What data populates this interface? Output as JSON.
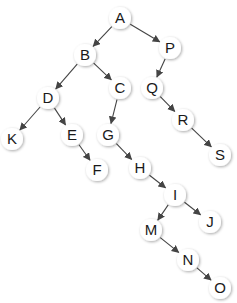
{
  "diagram": {
    "type": "binary-tree",
    "colors": {
      "background": "#ffffff",
      "node_fill": "#ffffff",
      "node_shadow": "#c8c8c8",
      "edge": "#444444",
      "text": "#1a1a1a"
    },
    "node_radius": 11,
    "nodes": [
      {
        "id": "A",
        "label": "A",
        "x": 120,
        "y": 18
      },
      {
        "id": "B",
        "label": "B",
        "x": 85,
        "y": 55
      },
      {
        "id": "P",
        "label": "P",
        "x": 170,
        "y": 48
      },
      {
        "id": "D",
        "label": "D",
        "x": 48,
        "y": 98
      },
      {
        "id": "C",
        "label": "C",
        "x": 120,
        "y": 88
      },
      {
        "id": "Q",
        "label": "Q",
        "x": 152,
        "y": 88
      },
      {
        "id": "K",
        "label": "K",
        "x": 12,
        "y": 139
      },
      {
        "id": "E",
        "label": "E",
        "x": 72,
        "y": 135
      },
      {
        "id": "G",
        "label": "G",
        "x": 108,
        "y": 135
      },
      {
        "id": "R",
        "label": "R",
        "x": 183,
        "y": 120
      },
      {
        "id": "S",
        "label": "S",
        "x": 220,
        "y": 155
      },
      {
        "id": "F",
        "label": "F",
        "x": 97,
        "y": 170
      },
      {
        "id": "H",
        "label": "H",
        "x": 140,
        "y": 168
      },
      {
        "id": "I",
        "label": "I",
        "x": 175,
        "y": 195
      },
      {
        "id": "M",
        "label": "M",
        "x": 151,
        "y": 230
      },
      {
        "id": "J",
        "label": "J",
        "x": 210,
        "y": 222
      },
      {
        "id": "N",
        "label": "N",
        "x": 188,
        "y": 260
      },
      {
        "id": "O",
        "label": "O",
        "x": 220,
        "y": 288
      }
    ],
    "edges": [
      {
        "from": "A",
        "to": "B"
      },
      {
        "from": "A",
        "to": "P"
      },
      {
        "from": "B",
        "to": "D"
      },
      {
        "from": "B",
        "to": "C"
      },
      {
        "from": "P",
        "to": "Q"
      },
      {
        "from": "D",
        "to": "K"
      },
      {
        "from": "D",
        "to": "E"
      },
      {
        "from": "C",
        "to": "G"
      },
      {
        "from": "Q",
        "to": "R"
      },
      {
        "from": "R",
        "to": "S"
      },
      {
        "from": "E",
        "to": "F"
      },
      {
        "from": "G",
        "to": "H"
      },
      {
        "from": "H",
        "to": "I"
      },
      {
        "from": "I",
        "to": "M"
      },
      {
        "from": "I",
        "to": "J"
      },
      {
        "from": "M",
        "to": "N"
      },
      {
        "from": "N",
        "to": "O"
      }
    ]
  }
}
